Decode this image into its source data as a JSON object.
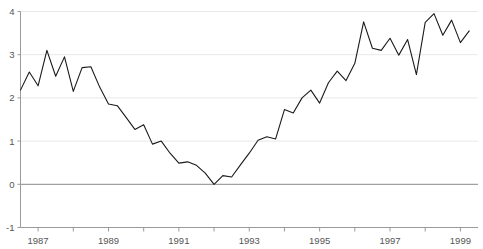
{
  "chart_data": {
    "type": "line",
    "title": "",
    "subtitle": "",
    "xlabel": "",
    "ylabel": "",
    "ylim": [
      -1,
      4
    ],
    "xlim": [
      1986.5,
      1999.5
    ],
    "yticks": [
      4,
      3,
      2,
      1,
      0,
      -1
    ],
    "ytick_labels": [
      "4",
      "3",
      "2",
      "1",
      "0",
      "-1"
    ],
    "xticks": [
      1987,
      1988,
      1989,
      1990,
      1991,
      1992,
      1993,
      1994,
      1995,
      1996,
      1997,
      1998,
      1999
    ],
    "xtick_labels": [
      "1987",
      "",
      "1989",
      "",
      "1991",
      "",
      "1993",
      "",
      "1995",
      "",
      "1997",
      "",
      "1999"
    ],
    "xtick_labels_shown": [
      "1987",
      "1989",
      "1991",
      "1993",
      "1995",
      "1997",
      "1999"
    ],
    "grid": true,
    "grid_axis": "y",
    "zero_line": true,
    "legend": null,
    "legend_position": "none",
    "line_color": "#1a1a1a",
    "line_width": 1.1,
    "grid_color": "#e8e8e8",
    "axis_color": "#9a9a9a",
    "zero_line_color": "#8a8a8a",
    "series": [
      {
        "name": "series-1",
        "x": [
          1986.5,
          1986.75,
          1987.0,
          1987.25,
          1987.5,
          1987.75,
          1988.0,
          1988.25,
          1988.5,
          1988.75,
          1989.0,
          1989.25,
          1989.5,
          1989.75,
          1990.0,
          1990.25,
          1990.5,
          1990.75,
          1991.0,
          1991.25,
          1991.5,
          1991.75,
          1992.0,
          1992.25,
          1992.5,
          1992.75,
          1993.0,
          1993.25,
          1993.5,
          1993.75,
          1994.0,
          1994.25,
          1994.5,
          1994.75,
          1995.0,
          1995.25,
          1995.5,
          1995.75,
          1996.0,
          1996.25,
          1996.5,
          1996.75,
          1997.0,
          1997.25,
          1997.5,
          1997.75,
          1998.0,
          1998.25,
          1998.5,
          1998.75,
          1999.0,
          1999.25
        ],
        "y": [
          2.18,
          2.6,
          2.28,
          3.1,
          2.5,
          2.95,
          2.15,
          2.7,
          2.72,
          2.25,
          1.86,
          1.82,
          1.55,
          1.27,
          1.38,
          0.93,
          1.0,
          0.72,
          0.49,
          0.52,
          0.44,
          0.26,
          0.0,
          0.2,
          0.17,
          0.45,
          0.72,
          1.02,
          1.1,
          1.05,
          1.73,
          1.65,
          2.0,
          2.18,
          1.88,
          2.35,
          2.62,
          2.4,
          2.8,
          3.76,
          3.15,
          3.1,
          3.38,
          2.99,
          3.35,
          2.54,
          3.75,
          3.95,
          3.45,
          3.8,
          3.28,
          3.55
        ]
      }
    ],
    "min_value": 0.0,
    "min_at": 1992.0,
    "max_value": 3.95,
    "max_at": 1998.25,
    "first_value": 2.18,
    "last_value": 3.55
  },
  "axes": {
    "y_axis_name": "value-axis",
    "x_axis_name": "time-axis"
  }
}
